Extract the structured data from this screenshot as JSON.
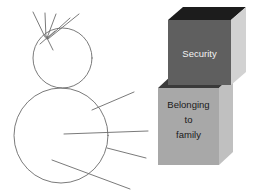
{
  "figure": {
    "background_color": "#ffffff",
    "stroke_color": "#6b6b6b"
  },
  "blocks": [
    {
      "id": "security",
      "label": "Security",
      "label_lines": [
        "Security"
      ],
      "position": "top",
      "front_color": "#5f5f5f",
      "top_color": "#1c1c1c",
      "side_color": "#d2d2d2",
      "text_color": "#f2f2f2"
    },
    {
      "id": "belonging-to-family",
      "label": "Belonging to family",
      "label_lines": [
        "Belonging",
        "to",
        "family"
      ],
      "position": "bottom",
      "front_color": "#a8a8a8",
      "top_color": "#3a3a3a",
      "side_color": "#c0c0c0",
      "text_color": "#1a1a1a"
    }
  ],
  "sketch": {
    "name": "stick-figure-sketch",
    "head": {
      "cx": 62.5,
      "cy": 58,
      "rx": 29.5,
      "ry": 30
    },
    "body": {
      "cx": 61,
      "cy": 135.5,
      "rx": 47,
      "ry": 47.5
    },
    "hair_lines": [
      {
        "x1": 45,
        "y1": 37,
        "x2": 33,
        "y2": 12
      },
      {
        "x1": 46,
        "y1": 38,
        "x2": 45,
        "y2": 13
      },
      {
        "x1": 47,
        "y1": 38,
        "x2": 56,
        "y2": 14
      },
      {
        "x1": 47,
        "y1": 39,
        "x2": 70,
        "y2": 18
      },
      {
        "x1": 48,
        "y1": 39,
        "x2": 79,
        "y2": 14
      },
      {
        "x1": 46,
        "y1": 36,
        "x2": 53,
        "y2": 50
      },
      {
        "x1": 55,
        "y1": 31,
        "x2": 40,
        "y2": 44
      }
    ],
    "body_lines": [
      {
        "x1": 92,
        "y1": 110,
        "x2": 134,
        "y2": 92
      },
      {
        "x1": 64,
        "y1": 134,
        "x2": 148,
        "y2": 131
      },
      {
        "x1": 107,
        "y1": 148,
        "x2": 146,
        "y2": 158
      },
      {
        "x1": 52,
        "y1": 160,
        "x2": 130,
        "y2": 189
      }
    ]
  }
}
